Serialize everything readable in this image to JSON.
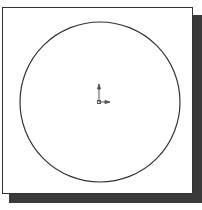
{
  "diagram": {
    "type": "sketch",
    "shapes": [
      {
        "kind": "circle",
        "cx": 100,
        "cy": 102,
        "r": 80,
        "stroke": "#333333"
      }
    ],
    "origin_marker": {
      "x": 100,
      "y": 102
    },
    "colors": {
      "frame_border": "#333333",
      "shadow": "#3a3a3a",
      "background": "#ffffff"
    }
  }
}
